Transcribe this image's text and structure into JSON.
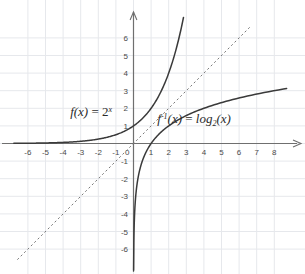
{
  "chart_data": {
    "type": "line",
    "title": "",
    "xlabel": "",
    "ylabel": "",
    "xlim": [
      -6.8,
      8.7
    ],
    "ylim": [
      -6.6,
      6.6
    ],
    "grid": true,
    "grid_step": 1,
    "legend_position": "inline-annotations",
    "axis_origin_label": "0",
    "xticks": [
      -6,
      -5,
      -4,
      -3,
      -2,
      -1,
      1,
      2,
      3,
      4,
      5,
      6,
      7,
      8
    ],
    "xtick_labels": [
      "-6",
      "-5",
      "-4",
      "-3",
      "-2",
      "-1",
      "1",
      "2",
      "3",
      "4",
      "5",
      "6",
      "7",
      "8"
    ],
    "yticks": [
      -6,
      -5,
      -4,
      -3,
      -2,
      -1,
      1,
      2,
      3,
      4,
      5,
      6
    ],
    "ytick_labels": [
      "-6",
      "-5",
      "-4",
      "-3",
      "-2",
      "-1",
      "1",
      "2",
      "3",
      "4",
      "5",
      "6"
    ],
    "series": [
      {
        "name": "f(x) = 2^x",
        "style": "solid",
        "color": "#3a3a3a",
        "x": [
          -6.8,
          -6,
          -5,
          -4,
          -3,
          -2,
          -1,
          0,
          0.5,
          1,
          1.5,
          2,
          2.5,
          2.75
        ],
        "values": [
          0.0089,
          0.0156,
          0.031,
          0.063,
          0.125,
          0.25,
          0.5,
          1,
          1.414,
          2,
          2.828,
          4,
          5.657,
          6.727
        ]
      },
      {
        "name": "f^-1(x) = log2(x)",
        "style": "solid",
        "color": "#3a3a3a",
        "x": [
          0.0156,
          0.031,
          0.063,
          0.125,
          0.25,
          0.5,
          1,
          2,
          3,
          4,
          5,
          6,
          7,
          8,
          8.7
        ],
        "values": [
          -6,
          -5,
          -4,
          -3,
          -2,
          -1,
          0,
          1,
          1.585,
          2,
          2.322,
          2.585,
          2.807,
          3,
          3.121
        ]
      },
      {
        "name": "y = x",
        "style": "dashed",
        "color": "#7a7a7a",
        "x": [
          -6.6,
          6.6
        ],
        "values": [
          -6.6,
          6.6
        ]
      }
    ],
    "annotations": [
      {
        "name": "exponential-function-label",
        "text": "f(x) = 2^x",
        "parts": {
          "fname": "f",
          "arg": "(x)",
          "eq": "=",
          "base": "2",
          "exp": "x"
        },
        "x": -3.6,
        "y": 1.55
      },
      {
        "name": "logarithm-function-label",
        "text": "f^-1(x) = log_2(x)",
        "parts": {
          "fname": "f",
          "inv": "-1",
          "arg": "(x)",
          "eq": "=",
          "op": "log",
          "subbase": "2",
          "tail": "(x)"
        },
        "x": 1.35,
        "y": 1.15
      }
    ],
    "colors": {
      "grid": "#e6e8ec",
      "axis": "#6f6f6f",
      "curve": "#3a3a3a",
      "identity_line": "#8a8a8a",
      "tick_text": "#4a4a4a",
      "background": "#ffffff"
    }
  }
}
